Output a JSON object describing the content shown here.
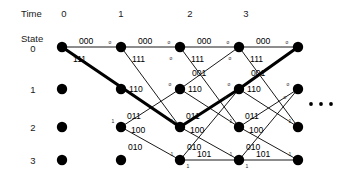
{
  "diagram": {
    "time_axis": {
      "label": "Time",
      "ticks": [
        "0",
        "1",
        "2",
        "3"
      ]
    },
    "state_axis": {
      "label": "State",
      "ticks": [
        "0",
        "1",
        "2",
        "3"
      ]
    },
    "ellipsis": "• • •",
    "colors": {
      "ink": "#000000",
      "background": "#ffffff",
      "highlight": "#000000"
    },
    "input_bit_marks": {
      "zero": "o",
      "one": "1"
    },
    "edge_labels": {
      "s0_s0": "000",
      "s0_s2": "111",
      "s1_s0": "001",
      "s1_s2": "110",
      "s2_s1": "011",
      "s2_s3": "100",
      "s3_s1": "010",
      "s3_s3": "101"
    },
    "nodes": {
      "columns_x": [
        62,
        121,
        180,
        239,
        298
      ],
      "rows_y": [
        47,
        89,
        127,
        160
      ],
      "radius": 5.2
    },
    "survivor_path": {
      "description": "highlighted maximum-likelihood path",
      "sequence": [
        "0,0",
        "1,2",
        "2,1",
        "3,0",
        "4,0"
      ],
      "output_bits": [
        "111",
        "011",
        "001",
        "000"
      ]
    }
  }
}
